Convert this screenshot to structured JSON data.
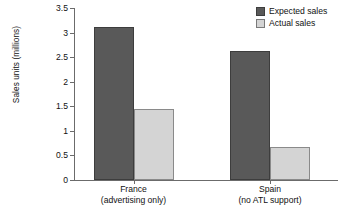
{
  "chart_data": {
    "type": "bar",
    "title": "",
    "xlabel": "",
    "ylabel": "Sales units (millions)",
    "ylim": [
      0,
      3.5
    ],
    "ytick_step": 0.5,
    "ytick_labels": [
      "0",
      "0.5",
      "1",
      "1.5",
      "2",
      "2.5",
      "3",
      "3.5"
    ],
    "ytick_values": [
      0,
      0.5,
      1,
      1.5,
      2,
      2.5,
      3,
      3.5
    ],
    "grid": false,
    "legend_position": "top-right",
    "categories": [
      "France",
      "Spain"
    ],
    "category_sublabels": [
      "(advertising only)",
      "(no ATL support)"
    ],
    "series": [
      {
        "name": "Expected sales",
        "color": "#595959",
        "values": [
          3.12,
          2.62
        ]
      },
      {
        "name": "Actual sales",
        "color": "#d4d4d4",
        "values": [
          1.45,
          0.67
        ]
      }
    ]
  },
  "legend": {
    "items": [
      {
        "label": "Expected sales",
        "swatch": "expected"
      },
      {
        "label": "Actual sales",
        "swatch": "actual"
      }
    ]
  },
  "axes": {
    "y_title": "Sales units (millions)"
  },
  "colors": {
    "expected": "#595959",
    "actual": "#d4d4d4",
    "axis": "#6b6b6b",
    "text": "#111111",
    "background": "#ffffff"
  }
}
